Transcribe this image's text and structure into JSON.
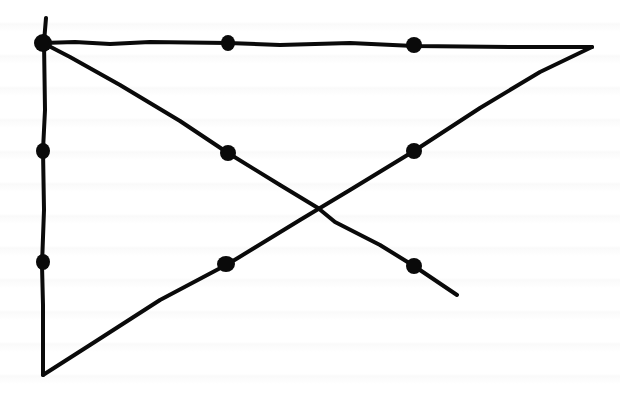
{
  "diagram": {
    "ink_color": "#0a0a0a",
    "background_color": "#ffffff",
    "dots": [
      {
        "id": "r1c1",
        "x": 43,
        "y": 43,
        "rx": 9,
        "ry": 9
      },
      {
        "id": "r1c2",
        "x": 228,
        "y": 43,
        "rx": 7,
        "ry": 8
      },
      {
        "id": "r1c3",
        "x": 414,
        "y": 45,
        "rx": 8,
        "ry": 8
      },
      {
        "id": "r2c1",
        "x": 43,
        "y": 151,
        "rx": 7,
        "ry": 8
      },
      {
        "id": "r2c2",
        "x": 228,
        "y": 153,
        "rx": 8,
        "ry": 8
      },
      {
        "id": "r2c3",
        "x": 414,
        "y": 151,
        "rx": 8,
        "ry": 8
      },
      {
        "id": "r3c1",
        "x": 43,
        "y": 262,
        "rx": 7,
        "ry": 8
      },
      {
        "id": "r3c2",
        "x": 226,
        "y": 264,
        "rx": 9,
        "ry": 8
      },
      {
        "id": "r3c3",
        "x": 414,
        "y": 266,
        "rx": 8,
        "ry": 8
      }
    ],
    "lines": [
      {
        "id": "line-1-vertical",
        "path": "M46 18 L44 42 L45 110 L43 150 L44 210 L42 265 L43 305 L43 375"
      },
      {
        "id": "line-2-top",
        "path": "M43 43 L75 42 L110 44 L150 42 L228 43 L280 45 L350 43 L414 46 L520 47 L592 47"
      },
      {
        "id": "line-3-return",
        "path": "M592 47 L540 72 L480 108 L414 151 L350 190 L300 220 L228 264 L160 300 L90 345 L43 375"
      },
      {
        "id": "line-4-diagonal",
        "path": "M43 43 L70 57 L120 85 L180 121 L228 153 L280 185 L318 208 L335 222 L380 245 L414 266 L457 295"
      }
    ],
    "crossing_point": {
      "x": 318,
      "y": 208
    }
  }
}
